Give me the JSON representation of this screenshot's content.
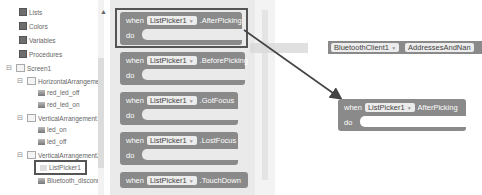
{
  "tree": {
    "builtins": [
      {
        "label": "Lists"
      },
      {
        "label": "Colors"
      },
      {
        "label": "Variables"
      },
      {
        "label": "Procedures"
      }
    ],
    "components": [
      {
        "label": "Screen1",
        "toggle": "⊟"
      },
      {
        "label": "HorizontalArrangemer",
        "toggle": "⊟"
      },
      {
        "label": "red_led_off"
      },
      {
        "label": "red_led_on"
      },
      {
        "label": "VerticalArrangement1",
        "toggle": "⊟"
      },
      {
        "label": "led_on"
      },
      {
        "label": "led_off"
      },
      {
        "label": "VerticalArrangement2",
        "toggle": "⊟"
      },
      {
        "label": "ListPicker1",
        "selected": true
      },
      {
        "label": "Bluetooth_disconne"
      }
    ]
  },
  "flyout": {
    "blocks": [
      {
        "when": "when",
        "component": "ListPicker1",
        "event": ".AfterPicking",
        "do": "do"
      },
      {
        "when": "when",
        "component": "ListPicker1",
        "event": ".BeforePicking",
        "do": "do"
      },
      {
        "when": "when",
        "component": "ListPicker1",
        "event": ".GotFocus",
        "do": "do"
      },
      {
        "when": "when",
        "component": "ListPicker1",
        "event": ".LostFocus",
        "do": "do"
      },
      {
        "when": "when",
        "component": "ListPicker1",
        "event": ".TouchDown",
        "do": "do"
      }
    ]
  },
  "workspace": {
    "bt_block": {
      "component": "BluetoothClient1",
      "property": "AddressesAndNan"
    },
    "ghost_to": "to",
    "placed_block": {
      "when": "when",
      "component": "ListPicker1",
      "event": "AfterPicking",
      "do": "do"
    }
  },
  "colors": {
    "block": "#8a8a8a",
    "highlight": "#555555"
  }
}
